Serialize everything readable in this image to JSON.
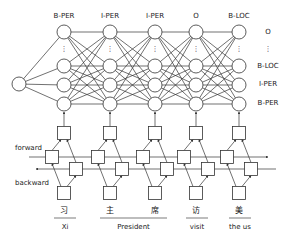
{
  "diagram": {
    "top_labels": [
      "B-PER",
      "I-PER",
      "I-PER",
      "O",
      "B-LOC"
    ],
    "right_labels": [
      "O",
      "⋮",
      "B-LOC",
      "I-PER",
      "B-PER"
    ],
    "direction_labels": {
      "forward": "forward",
      "backward": "backward"
    },
    "tokens_zh": [
      "习",
      "主",
      "席",
      "访",
      "美"
    ],
    "tokens_en": [
      {
        "text": "Xi",
        "span": [
          0,
          0
        ]
      },
      {
        "text": "President",
        "span": [
          1,
          2
        ]
      },
      {
        "text": "visit",
        "span": [
          3,
          3
        ]
      },
      {
        "text": "the us",
        "span": [
          4,
          4
        ]
      }
    ],
    "colors": {
      "line": "#333333",
      "text": "#222222",
      "background": "#ffffff"
    }
  }
}
